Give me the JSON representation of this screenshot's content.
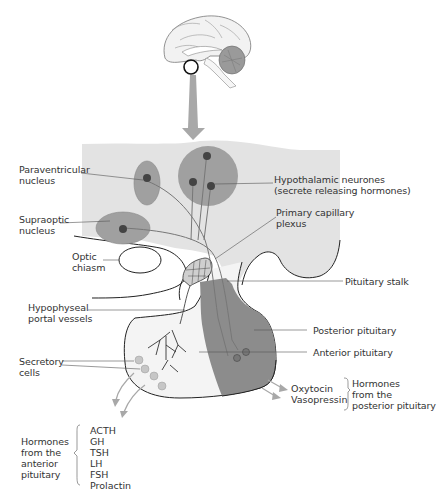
{
  "diagram": {
    "colors": {
      "background": "#ffffff",
      "brain_tissue": "#e3e3e3",
      "nucleus": "#9e9e9e",
      "neurone_body": "#444444",
      "posterior_pituitary": "#8c8c8c",
      "anterior_pituitary": "#f4f4f4",
      "arrow": "#a8a8a8",
      "outline": "#222222"
    },
    "labels": {
      "paraventricular": "Paraventricular\nnucleus",
      "hypothalamic_neurones": "Hypothalamic neurones\n(secrete releasing hormones)",
      "supraoptic": "Supraoptic\nnucleus",
      "primary_capillary": "Primary capillary\nplexus",
      "optic_chiasm": "Optic\nchiasm",
      "pituitary_stalk": "Pituitary stalk",
      "portal_vessels": "Hypophyseal\nportal vessels",
      "posterior_pituitary": "Posterior pituitary",
      "anterior_pituitary": "Anterior pituitary",
      "secretory_cells": "Secretory\ncells"
    },
    "posterior_hormones": {
      "items": [
        "Oxytocin",
        "Vasopressin"
      ],
      "group_label": "Hormones\nfrom the\nposterior pituitary"
    },
    "anterior_hormones": {
      "group_label": "Hormones\nfrom the\nanterior\npituitary",
      "items": [
        "ACTH",
        "GH",
        "TSH",
        "LH",
        "FSH",
        "Prolactin"
      ]
    }
  }
}
